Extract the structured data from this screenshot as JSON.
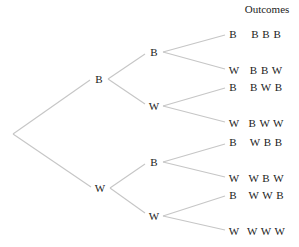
{
  "header": {
    "outcomes_title": "Outcomes"
  },
  "tree": {
    "level1": [
      {
        "label": "B"
      },
      {
        "label": "W"
      }
    ],
    "level2": [
      {
        "label": "B"
      },
      {
        "label": "W"
      },
      {
        "label": "B"
      },
      {
        "label": "W"
      }
    ],
    "level3": [
      {
        "label": "B"
      },
      {
        "label": "W"
      },
      {
        "label": "B"
      },
      {
        "label": "W"
      },
      {
        "label": "B"
      },
      {
        "label": "W"
      },
      {
        "label": "B"
      },
      {
        "label": "W"
      }
    ]
  },
  "outcomes": [
    "B B B",
    "B B W",
    "B W B",
    "B W W",
    "W B B",
    "W B W",
    "W W B",
    "W W W"
  ],
  "colors": {
    "branch": "#c8c8c8",
    "text": "#222222"
  }
}
